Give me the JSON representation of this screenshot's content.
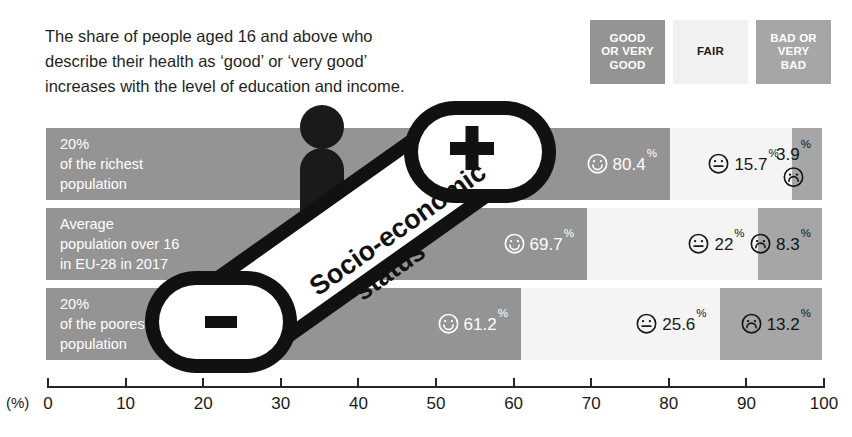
{
  "title": {
    "line1": "The share of people aged 16 and above who",
    "line2": "describe their health as ‘good’ or ‘very good’",
    "line3": "increases with the level of education and income."
  },
  "legend": {
    "items": [
      {
        "name": "good",
        "line1": "GOOD",
        "line2": "OR VERY",
        "line3": "GOOD",
        "color": "#949494",
        "text_color": "#ffffff"
      },
      {
        "name": "fair",
        "line1": "",
        "line2": "FAIR",
        "line3": "",
        "color": "#f1f1f1",
        "text_color": "#1a1a1a"
      },
      {
        "name": "bad",
        "line1": "BAD OR",
        "line2": "VERY",
        "line3": "BAD",
        "color": "#a6a6a6",
        "text_color": "#ffffff"
      }
    ]
  },
  "escalator": {
    "label_line1": "Socio-economic",
    "label_line2": "status",
    "plus": "+",
    "minus": "-"
  },
  "axis": {
    "unit_label": "(%)",
    "ticks": [
      "0",
      "10",
      "20",
      "30",
      "40",
      "50",
      "60",
      "70",
      "80",
      "90",
      "100"
    ]
  },
  "chart_data": {
    "type": "bar",
    "orientation": "horizontal",
    "stacked": true,
    "title": "The share of people aged 16 and above who describe their health as ‘good’ or ‘very good’ increases with the level of education and income.",
    "xlabel": "(%)",
    "ylabel": "",
    "xlim": [
      0,
      100
    ],
    "grid": false,
    "legend_position": "top-right",
    "categories": [
      "20% of the richest population",
      "Average population over 16 in EU-28 in 2017",
      "20% of the poorest population"
    ],
    "series": [
      {
        "name": "GOOD OR VERY GOOD",
        "color": "#949494",
        "values": [
          80.4,
          69.7,
          61.2
        ]
      },
      {
        "name": "FAIR",
        "color": "#f4f4f4",
        "values": [
          15.7,
          22,
          25.6
        ]
      },
      {
        "name": "BAD OR VERY BAD",
        "color": "#a6a6a6",
        "values": [
          3.9,
          8.3,
          13.2
        ]
      }
    ]
  },
  "rows": [
    {
      "label_lines": [
        "20%",
        "of the richest",
        "population"
      ],
      "good": {
        "value": "80.4",
        "pct": "%",
        "icon": "smiley-happy-icon"
      },
      "fair": {
        "value": "15.7",
        "pct": "%",
        "icon": "smiley-neutral-icon"
      },
      "bad": {
        "value": "3.9",
        "pct": "%",
        "icon": "smiley-sad-icon"
      }
    },
    {
      "label_lines": [
        "Average",
        "population over 16",
        "in EU-28 in 2017"
      ],
      "good": {
        "value": "69.7",
        "pct": "%",
        "icon": "smiley-happy-icon"
      },
      "fair": {
        "value": "22",
        "pct": "%",
        "icon": "smiley-neutral-icon"
      },
      "bad": {
        "value": "8.3",
        "pct": "%",
        "icon": "smiley-sad-icon"
      }
    },
    {
      "label_lines": [
        "20%",
        "of the poorest",
        "population"
      ],
      "good": {
        "value": "61.2",
        "pct": "%",
        "icon": "smiley-happy-icon"
      },
      "fair": {
        "value": "25.6",
        "pct": "%",
        "icon": "smiley-neutral-icon"
      },
      "bad": {
        "value": "13.2",
        "pct": "%",
        "icon": "smiley-sad-icon"
      }
    }
  ]
}
